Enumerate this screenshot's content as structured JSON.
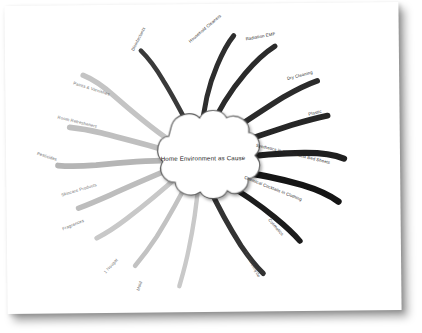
{
  "diagram": {
    "type": "mind-map",
    "title": "Home Environment as Cause",
    "center": {
      "label": "Home Environment as Cause",
      "shape": "cloud",
      "fill": "#ffffff",
      "stroke": "#555555"
    },
    "background": "#ffffff",
    "branches": [
      {
        "id": "disinfectants",
        "label": "Disinfectants",
        "color": "#3a3a3a",
        "angle_deg": -108,
        "side": "top",
        "label_x": 128,
        "label_y": 44,
        "label_rot": -62,
        "tone": "mid"
      },
      {
        "id": "household-cleaners",
        "label": "Household Cleaners",
        "color": "#2e2e2e",
        "angle_deg": -84,
        "side": "top",
        "label_x": 185,
        "label_y": 36,
        "label_rot": -40,
        "tone": "dark"
      },
      {
        "id": "radiation-emf",
        "label": "Radiation EMF",
        "color": "#2b2b2b",
        "angle_deg": -62,
        "side": "top-right",
        "label_x": 241,
        "label_y": 34,
        "label_rot": -10,
        "tone": "dark"
      },
      {
        "id": "dry-cleaning",
        "label": "Dry Cleaning",
        "color": "#2b2b2b",
        "angle_deg": -38,
        "side": "right",
        "label_x": 282,
        "label_y": 74,
        "label_rot": -14,
        "tone": "dark"
      },
      {
        "id": "plastic",
        "label": "Plastic",
        "color": "#262626",
        "angle_deg": -20,
        "side": "right",
        "label_x": 301,
        "label_y": 108,
        "label_rot": -14,
        "tone": "dark"
      },
      {
        "id": "synthetics",
        "label": "Synthetics in Clothes and Bed Sheets",
        "color": "#1f1f1f",
        "angle_deg": -4,
        "side": "right",
        "label_x": 256,
        "label_y": 142,
        "label_rot": 14,
        "tone": "dark"
      },
      {
        "id": "chemical-cocktails",
        "label": "Chemical Cocktails in Clothing",
        "color": "#151515",
        "angle_deg": 14,
        "side": "right",
        "label_x": 240,
        "label_y": 174,
        "label_rot": 22,
        "tone": "dark"
      },
      {
        "id": "cosmetics",
        "label": "Cosmetics",
        "color": "#1c1c1c",
        "angle_deg": 40,
        "side": "bottom-right",
        "label_x": 262,
        "label_y": 215,
        "label_rot": 50,
        "tone": "dark"
      },
      {
        "id": "formaldehyde",
        "label": "Formaldehyde",
        "color": "#333333",
        "angle_deg": 66,
        "side": "bottom",
        "label_x": 240,
        "label_y": 248,
        "label_rot": 62,
        "tone": "mid"
      },
      {
        "id": "mold",
        "label": "Mold",
        "color": "#c9c9c9",
        "angle_deg": 104,
        "side": "bottom",
        "label_x": 131,
        "label_y": 281,
        "label_rot": -72,
        "tone": "light"
      },
      {
        "id": "nougat",
        "label": "1 Nougat",
        "color": "#c2c2c2",
        "angle_deg": 128,
        "side": "bottom-left",
        "label_x": 100,
        "label_y": 264,
        "label_rot": -48,
        "tone": "light"
      },
      {
        "id": "fragrances",
        "label": "Fragrances",
        "color": "#c8c8c8",
        "angle_deg": 152,
        "side": "left",
        "label_x": 58,
        "label_y": 220,
        "label_rot": -22,
        "tone": "light"
      },
      {
        "id": "skincare-products",
        "label": "Skincare Products",
        "color": "#bdbdbd",
        "angle_deg": 170,
        "side": "left",
        "label_x": 57,
        "label_y": 186,
        "label_rot": -16,
        "tone": "light"
      },
      {
        "id": "pesticides",
        "label": "Pesticides",
        "color": "#b5b5b5",
        "angle_deg": 188,
        "side": "left",
        "label_x": 33,
        "label_y": 148,
        "label_rot": 18,
        "tone": "light"
      },
      {
        "id": "room-refresheners",
        "label": "Room Refresheners",
        "color": "#bfbfbf",
        "angle_deg": 206,
        "side": "left",
        "label_x": 54,
        "label_y": 112,
        "label_rot": 14,
        "tone": "light"
      },
      {
        "id": "paints-varnishes",
        "label": "Paints & Varnishes",
        "color": "#c4c4c4",
        "angle_deg": 228,
        "side": "top-left",
        "label_x": 70,
        "label_y": 78,
        "label_rot": 18,
        "tone": "light"
      }
    ]
  }
}
